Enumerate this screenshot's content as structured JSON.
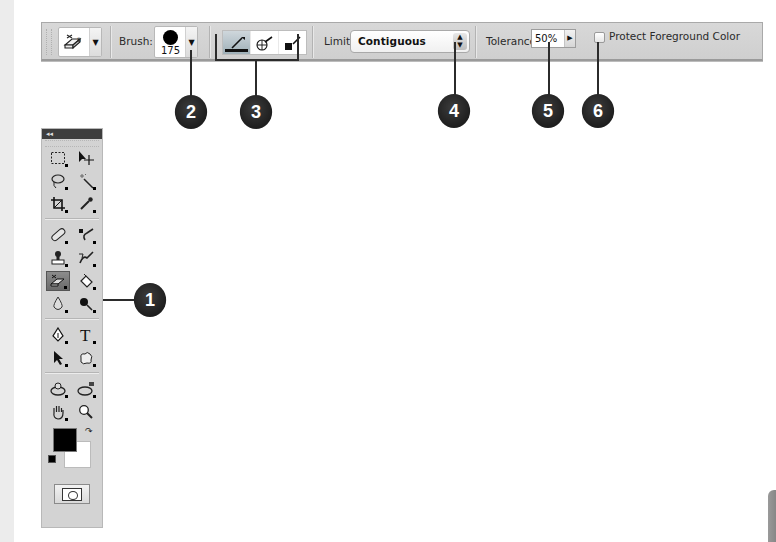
{
  "options_bar": {
    "tool_preset_icon": "background-eraser-icon",
    "brush_label": "Brush:",
    "brush_size": "175",
    "sampling_buttons": [
      {
        "name": "sampling-continuous",
        "icon": "eyedropper-continuous-icon",
        "active": true
      },
      {
        "name": "sampling-once",
        "icon": "eyedropper-once-icon",
        "active": false
      },
      {
        "name": "sampling-background-swatch",
        "icon": "eyedropper-background-swatch-icon",
        "active": false
      }
    ],
    "limits_label": "Limits:",
    "limits_value": "Contiguous",
    "tolerance_label": "Tolerance:",
    "tolerance_value": "50%",
    "protect_label": "Protect Foreground Color",
    "protect_checked": false
  },
  "callouts": [
    {
      "number": "1",
      "target": "background-eraser-tool"
    },
    {
      "number": "2",
      "target": "brush-picker"
    },
    {
      "number": "3",
      "target": "sampling-buttons"
    },
    {
      "number": "4",
      "target": "limits-select"
    },
    {
      "number": "5",
      "target": "tolerance-field"
    },
    {
      "number": "6",
      "target": "protect-foreground-checkbox"
    }
  ],
  "toolbox": {
    "collapse_label": "◂◂",
    "groups": [
      [
        [
          "marquee-tool",
          "move-tool"
        ],
        [
          "lasso-tool",
          "magic-wand-tool"
        ],
        [
          "crop-tool",
          "eyedropper-tool"
        ]
      ],
      [
        [
          "healing-brush-tool",
          "brush-tool"
        ],
        [
          "clone-stamp-tool",
          "history-brush-tool"
        ],
        [
          "background-eraser-tool",
          "paint-bucket-tool"
        ],
        [
          "blur-tool",
          "burn-tool"
        ]
      ],
      [
        [
          "pen-tool",
          "type-tool"
        ],
        [
          "path-selection-tool",
          "custom-shape-tool"
        ]
      ],
      [
        [
          "3d-rotate-tool",
          "3d-orbit-tool"
        ],
        [
          "hand-tool",
          "zoom-tool"
        ]
      ]
    ],
    "foreground_color": "#000000",
    "background_color": "#ffffff"
  },
  "colors": {
    "toolbar_bg": "#d4d4d4",
    "callout_bg": "#262626",
    "toolbox_header": "#3e3e3e"
  }
}
